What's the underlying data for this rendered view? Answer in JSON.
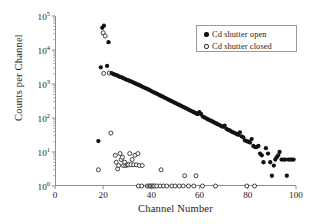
{
  "figure": {
    "background": "#ffffff",
    "frame_color": "#8d8d8d",
    "marker_filled_color": "#111111",
    "marker_open_color": "#222222"
  },
  "axes": {
    "xlabel": "Channel Number",
    "ylabel": "Counts per Channel",
    "x_ticks": [
      "0",
      "20",
      "40",
      "60",
      "80",
      "100"
    ],
    "y_ticks": [
      "10",
      "10",
      "10",
      "10",
      "10",
      "10"
    ],
    "y_exponents": [
      "5",
      "4",
      "3",
      "2",
      "1",
      "0"
    ]
  },
  "legend": {
    "position": "top-right",
    "entries": [
      {
        "label": "Cd shutter open",
        "marker": "filled-circle-icon"
      },
      {
        "label": "Cd shutter closed",
        "marker": "open-circle-icon"
      }
    ]
  },
  "chart_data": {
    "type": "scatter",
    "title": "",
    "xlabel": "Channel Number",
    "ylabel": "Counts per Channel",
    "xlim": [
      0,
      100
    ],
    "ylim": [
      1,
      100000
    ],
    "yscale": "log",
    "xscale": "linear",
    "grid": false,
    "legend_position": "upper right",
    "series": [
      {
        "name": "Cd shutter open",
        "marker": "filled-circle",
        "points": [
          [
            18,
            21
          ],
          [
            19,
            3100
          ],
          [
            21.6,
            3400
          ],
          [
            19.6,
            45000
          ],
          [
            20.3,
            52000
          ],
          [
            22.2,
            17000
          ],
          [
            23.5,
            2100
          ],
          [
            24.2,
            1950
          ],
          [
            24.9,
            1880
          ],
          [
            25.6,
            1820
          ],
          [
            26.3,
            1700
          ],
          [
            27.0,
            1620
          ],
          [
            27.7,
            1560
          ],
          [
            28.4,
            1480
          ],
          [
            29.1,
            1400
          ],
          [
            29.8,
            1330
          ],
          [
            30.5,
            1280
          ],
          [
            31.2,
            1210
          ],
          [
            31.9,
            1160
          ],
          [
            32.6,
            1100
          ],
          [
            33.3,
            1040
          ],
          [
            34.0,
            990
          ],
          [
            34.7,
            940
          ],
          [
            35.4,
            890
          ],
          [
            36.1,
            840
          ],
          [
            36.8,
            800
          ],
          [
            37.5,
            760
          ],
          [
            38.2,
            720
          ],
          [
            38.9,
            680
          ],
          [
            39.6,
            640
          ],
          [
            40.3,
            600
          ],
          [
            41.0,
            570
          ],
          [
            41.7,
            540
          ],
          [
            42.4,
            510
          ],
          [
            43.1,
            480
          ],
          [
            43.8,
            455
          ],
          [
            44.5,
            430
          ],
          [
            45.2,
            405
          ],
          [
            45.9,
            385
          ],
          [
            46.6,
            360
          ],
          [
            47.3,
            340
          ],
          [
            48.0,
            322
          ],
          [
            48.7,
            305
          ],
          [
            49.4,
            288
          ],
          [
            50.1,
            272
          ],
          [
            50.8,
            257
          ],
          [
            51.5,
            243
          ],
          [
            52.2,
            230
          ],
          [
            52.9,
            217
          ],
          [
            53.6,
            205
          ],
          [
            54.3,
            194
          ],
          [
            55.0,
            183
          ],
          [
            55.7,
            173
          ],
          [
            56.4,
            163
          ],
          [
            57.1,
            154
          ],
          [
            57.8,
            146
          ],
          [
            58.5,
            138
          ],
          [
            59.2,
            130
          ],
          [
            59.9,
            148
          ],
          [
            60.6,
            131
          ],
          [
            61.3,
            110
          ],
          [
            62.0,
            104
          ],
          [
            62.7,
            98
          ],
          [
            63.4,
            92
          ],
          [
            64.1,
            87
          ],
          [
            64.8,
            82
          ],
          [
            65.5,
            78
          ],
          [
            66.2,
            73
          ],
          [
            66.9,
            69
          ],
          [
            67.6,
            65
          ],
          [
            68.3,
            62
          ],
          [
            69.0,
            58
          ],
          [
            69.7,
            55
          ],
          [
            70.4,
            60
          ],
          [
            71.1,
            48
          ],
          [
            71.8,
            45
          ],
          [
            72.5,
            43
          ],
          [
            73.2,
            40
          ],
          [
            73.9,
            38
          ],
          [
            74.6,
            36
          ],
          [
            75.3,
            34
          ],
          [
            76.0,
            32
          ],
          [
            76.7,
            38
          ],
          [
            77.4,
            29
          ],
          [
            78.1,
            27
          ],
          [
            78.8,
            22
          ],
          [
            79.5,
            21
          ],
          [
            80.2,
            20
          ],
          [
            80.9,
            19
          ],
          [
            81.6,
            24
          ],
          [
            82.3,
            15
          ],
          [
            83.0,
            14
          ],
          [
            83.7,
            14
          ],
          [
            84.4,
            15
          ],
          [
            85.1,
            9
          ],
          [
            85.8,
            8
          ],
          [
            86.5,
            5
          ],
          [
            87.5,
            13
          ],
          [
            88.4,
            9
          ],
          [
            89.3,
            5
          ],
          [
            90.0,
            2
          ],
          [
            90.8,
            4
          ],
          [
            91.4,
            6
          ],
          [
            92.0,
            7
          ],
          [
            92.6,
            8
          ],
          [
            93.2,
            10
          ],
          [
            94.0,
            6
          ],
          [
            94.8,
            6
          ],
          [
            95.5,
            6
          ],
          [
            96.2,
            2
          ],
          [
            96.8,
            6
          ],
          [
            97.6,
            6
          ],
          [
            98.3,
            6
          ],
          [
            99.0,
            6
          ]
        ]
      },
      {
        "name": "Cd shutter closed",
        "marker": "open-circle",
        "points": [
          [
            20.0,
            32000
          ],
          [
            20.8,
            26000
          ],
          [
            20.2,
            2050
          ],
          [
            22.5,
            2100
          ],
          [
            18.0,
            3
          ],
          [
            23.2,
            36
          ],
          [
            25.0,
            8
          ],
          [
            25.4,
            5
          ],
          [
            26.0,
            3.2
          ],
          [
            26.4,
            4
          ],
          [
            27.0,
            9
          ],
          [
            27.5,
            6
          ],
          [
            28.0,
            7
          ],
          [
            28.4,
            4
          ],
          [
            28.9,
            5
          ],
          [
            29.4,
            4
          ],
          [
            30.0,
            4.2
          ],
          [
            30.5,
            4.2
          ],
          [
            31.0,
            9
          ],
          [
            31.5,
            4.2
          ],
          [
            32.0,
            6
          ],
          [
            32.6,
            4.2
          ],
          [
            33.2,
            8
          ],
          [
            33.8,
            4.2
          ],
          [
            34.4,
            9
          ],
          [
            35.0,
            4
          ],
          [
            36.2,
            4
          ],
          [
            44.0,
            3
          ],
          [
            53.8,
            2
          ],
          [
            58.5,
            2
          ],
          [
            34.6,
            1
          ],
          [
            36.0,
            1
          ],
          [
            38.3,
            1
          ],
          [
            39.0,
            1
          ],
          [
            39.6,
            1
          ],
          [
            40.2,
            1
          ],
          [
            40.8,
            1
          ],
          [
            41.4,
            1
          ],
          [
            42.2,
            1
          ],
          [
            43.6,
            1
          ],
          [
            45.0,
            1
          ],
          [
            46.4,
            1
          ],
          [
            48.5,
            1
          ],
          [
            49.8,
            1
          ],
          [
            51.6,
            1
          ],
          [
            53.2,
            1
          ],
          [
            55.4,
            1
          ],
          [
            57.6,
            1
          ],
          [
            61.2,
            1
          ],
          [
            66.6,
            1
          ],
          [
            79.6,
            1
          ],
          [
            82.8,
            1
          ]
        ]
      }
    ]
  }
}
